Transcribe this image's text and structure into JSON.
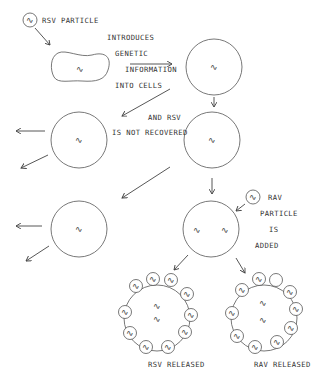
{
  "diagram": {
    "type": "biological process flow",
    "squiggle_glyph": "∿",
    "colors": {
      "line": "#444444",
      "text": "#333333",
      "background": "#ffffff"
    },
    "labels": {
      "rsv_particle": "RSV PARTICLE",
      "introduces": "INTRODUCES",
      "genetic": "GENETIC",
      "information": "INFORMATION",
      "into_cells": "INTO CELLS",
      "and_rsv": "AND RSV",
      "is_not_recovered": "IS NOT RECOVERED",
      "rav": "RAV",
      "particle": "PARTICLE",
      "is": "IS",
      "added": "ADDED",
      "rsv_released": "RSV RELEASED",
      "rav_released": "RAV RELEASED"
    }
  }
}
